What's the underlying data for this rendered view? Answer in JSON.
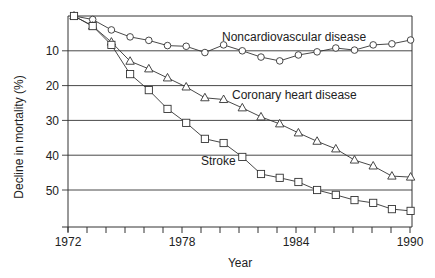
{
  "chart_data": {
    "type": "line",
    "title": "",
    "xlabel": "Year",
    "ylabel": "Decline in mortality (%)",
    "y_inverted": true,
    "ylim": [
      0,
      57
    ],
    "xlim": [
      1972,
      1990
    ],
    "grid": "horizontal",
    "x_ticks": [
      1972,
      1973,
      1974,
      1975,
      1976,
      1977,
      1978,
      1979,
      1980,
      1981,
      1982,
      1983,
      1984,
      1985,
      1986,
      1987,
      1988,
      1989,
      1990
    ],
    "x_tick_labels": [
      "1972",
      "1978",
      "1984",
      "1990"
    ],
    "y_tick_labels": [
      "10",
      "20",
      "30",
      "40",
      "50"
    ],
    "x": [
      1972,
      1973,
      1974,
      1975,
      1976,
      1977,
      1978,
      1979,
      1980,
      1981,
      1982,
      1983,
      1984,
      1985,
      1986,
      1987,
      1988,
      1989,
      1990
    ],
    "series": [
      {
        "name": "Noncardiovascular disease",
        "marker": "circle",
        "values": [
          0,
          1,
          4,
          6,
          7,
          8.5,
          8.7,
          10.5,
          8.3,
          10,
          11.8,
          12.9,
          11.2,
          10.3,
          9.2,
          9.8,
          8.3,
          8,
          6.9
        ]
      },
      {
        "name": "Coronary heart disease",
        "marker": "triangle",
        "values": [
          0,
          2.9,
          7.5,
          13,
          15.2,
          17.8,
          20.4,
          23.5,
          24,
          26.4,
          29,
          31,
          33.6,
          36,
          38.2,
          41.4,
          43.1,
          46,
          46.3
        ]
      },
      {
        "name": "Stroke",
        "marker": "square",
        "values": [
          0,
          2.9,
          8.3,
          16.7,
          21.3,
          26.7,
          30.7,
          35.3,
          36.5,
          40.5,
          45.4,
          46.5,
          47.7,
          50,
          51.4,
          52.9,
          53.7,
          55.5,
          56
        ]
      }
    ],
    "annotations": [
      {
        "text": "Noncardiovascular disease",
        "series": "Noncardiovascular disease"
      },
      {
        "text": "Coronary heart disease",
        "series": "Coronary heart disease"
      },
      {
        "text": "Stroke",
        "series": "Stroke"
      }
    ]
  }
}
